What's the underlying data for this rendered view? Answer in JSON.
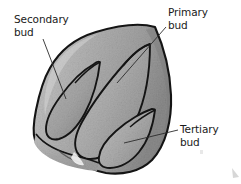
{
  "figure": {
    "kind": "botanical-illustration",
    "background_color": "#ffffff",
    "ink_color": "#141414",
    "leader_line_color": "#2b2b2b",
    "fill_light": "#c3c3c3",
    "fill_mid": "#a9a9a9",
    "fill_dark": "#8d8d8d",
    "fill_shadow": "#777777"
  },
  "labels": {
    "secondary": {
      "text": "Secondary\nbud",
      "line1": "Secondary",
      "line2": "bud"
    },
    "primary": {
      "text": "Primary\nbud",
      "line1": "Primary",
      "line2": "bud"
    },
    "tertiary": {
      "text": "Tertiary\nbud",
      "line1": "Tertiary",
      "line2": "bud"
    }
  },
  "parts": [
    {
      "id": "primary-bud",
      "name": "Primary bud"
    },
    {
      "id": "secondary-bud",
      "name": "Secondary bud"
    },
    {
      "id": "tertiary-bud",
      "name": "Tertiary bud"
    }
  ]
}
